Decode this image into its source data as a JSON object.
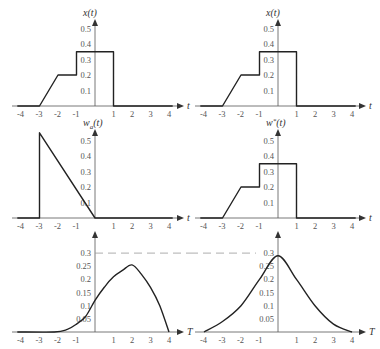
{
  "chart_data": [
    {
      "type": "line",
      "panel": "top-left",
      "ylabel": "x(t)",
      "xlabel": "t",
      "x_ticks": [
        "-4",
        "-3",
        "-2",
        "-1",
        "1",
        "2",
        "3",
        "4"
      ],
      "y_ticks": [
        "0.1",
        "0.2",
        "0.3",
        "0.4",
        "0.5"
      ],
      "x": [
        -4.2,
        -3,
        -2,
        -1,
        -1,
        1,
        1,
        4.2
      ],
      "y": [
        0,
        0,
        0.2,
        0.2,
        0.35,
        0.35,
        0,
        0
      ]
    },
    {
      "type": "line",
      "panel": "top-right",
      "ylabel": "x(t)",
      "xlabel": "t",
      "x_ticks": [
        "-4",
        "-3",
        "-2",
        "-1",
        "1",
        "2",
        "3",
        "4"
      ],
      "y_ticks": [
        "0.1",
        "0.2",
        "0.3",
        "0.4",
        "0.5"
      ],
      "x": [
        -4.2,
        -3,
        -2,
        -1,
        -1,
        1,
        1,
        4.2
      ],
      "y": [
        0,
        0,
        0.2,
        0.2,
        0.35,
        0.35,
        0,
        0
      ]
    },
    {
      "type": "line",
      "panel": "middle-left",
      "ylabel": "w_a(t)",
      "xlabel": "t",
      "x_ticks": [
        "-4",
        "-3",
        "-2",
        "-1",
        "1",
        "2",
        "3",
        "4"
      ],
      "y_ticks": [
        "0.1",
        "0.2",
        "0.3",
        "0.4",
        "0.5"
      ],
      "x": [
        -4.2,
        -3,
        -3,
        0,
        4.2
      ],
      "y": [
        0,
        0,
        0.55,
        0,
        0
      ]
    },
    {
      "type": "line",
      "panel": "middle-right",
      "ylabel": "w*(t)",
      "xlabel": "t",
      "x_ticks": [
        "-4",
        "-3",
        "-2",
        "-1",
        "1",
        "2",
        "3",
        "4"
      ],
      "y_ticks": [
        "0.1",
        "0.2",
        "0.3",
        "0.4",
        "0.5"
      ],
      "x": [
        -4.2,
        -3,
        -2,
        -1,
        -1,
        1,
        1,
        4.2
      ],
      "y": [
        0,
        0,
        0.2,
        0.2,
        0.35,
        0.35,
        0,
        0
      ]
    },
    {
      "type": "line",
      "panel": "bottom-left",
      "ylabel": "",
      "xlabel": "T",
      "x_ticks": [
        "-4",
        "-3",
        "-2",
        "-1",
        "1",
        "2",
        "3",
        "4"
      ],
      "y_ticks": [
        "0.05",
        "0.1",
        "0.15",
        "0.2",
        "0.25",
        "0.3"
      ],
      "x": [
        -4.2,
        -2.2,
        -1.5,
        -1,
        -0.5,
        0,
        0.5,
        1,
        1.5,
        2,
        2.5,
        3,
        3.5,
        4
      ],
      "y": [
        0,
        0,
        0.01,
        0.03,
        0.06,
        0.12,
        0.17,
        0.21,
        0.235,
        0.255,
        0.22,
        0.17,
        0.1,
        0
      ],
      "reference_line": 0.3
    },
    {
      "type": "line",
      "panel": "bottom-right",
      "ylabel": "",
      "xlabel": "T",
      "x_ticks": [
        "-4",
        "-3",
        "-2",
        "-1",
        "1",
        "2",
        "3",
        "4"
      ],
      "y_ticks": [
        "0.05",
        "0.1",
        "0.15",
        "0.2",
        "0.25",
        "0.3"
      ],
      "x": [
        -4,
        -3,
        -2,
        -1,
        0,
        1,
        2,
        3,
        4
      ],
      "y": [
        0,
        0.04,
        0.1,
        0.2,
        0.29,
        0.2,
        0.1,
        0.03,
        0
      ],
      "reference_line": 0.3
    }
  ]
}
